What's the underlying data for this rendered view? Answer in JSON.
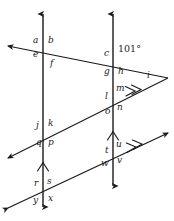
{
  "figure": {
    "stroke_color": "#1a1a1a",
    "background_color": "#ffffff",
    "width": 174,
    "height": 221
  },
  "angle_measures": [
    {
      "id": "measure-101",
      "text": "101°",
      "x": 118,
      "y": 49
    }
  ],
  "angle_labels": [
    {
      "id": "a",
      "text": "a",
      "x": 33,
      "y": 41
    },
    {
      "id": "b",
      "text": "b",
      "x": 48,
      "y": 41
    },
    {
      "id": "e",
      "text": "e",
      "x": 33,
      "y": 55
    },
    {
      "id": "f",
      "text": "f",
      "x": 50,
      "y": 64
    },
    {
      "id": "c",
      "text": "c",
      "x": 104,
      "y": 54
    },
    {
      "id": "g",
      "text": "g",
      "x": 104,
      "y": 72
    },
    {
      "id": "h",
      "text": "h",
      "x": 118,
      "y": 72
    },
    {
      "id": "i",
      "text": "i",
      "x": 147,
      "y": 76
    },
    {
      "id": "m",
      "text": "m",
      "x": 116,
      "y": 89
    },
    {
      "id": "l",
      "text": "l",
      "x": 105,
      "y": 97
    },
    {
      "id": "n",
      "text": "n",
      "x": 117,
      "y": 108
    },
    {
      "id": "o",
      "text": "o",
      "x": 105,
      "y": 112
    },
    {
      "id": "j",
      "text": "j",
      "x": 36,
      "y": 126
    },
    {
      "id": "k",
      "text": "k",
      "x": 48,
      "y": 124
    },
    {
      "id": "q",
      "text": "q",
      "x": 36,
      "y": 143
    },
    {
      "id": "p",
      "text": "p",
      "x": 48,
      "y": 143
    },
    {
      "id": "u",
      "text": "u",
      "x": 116,
      "y": 145
    },
    {
      "id": "t",
      "text": "t",
      "x": 105,
      "y": 151
    },
    {
      "id": "v",
      "text": "v",
      "x": 117,
      "y": 161
    },
    {
      "id": "w",
      "text": "w",
      "x": 101,
      "y": 164
    },
    {
      "id": "r",
      "text": "r",
      "x": 34,
      "y": 184
    },
    {
      "id": "s",
      "text": "s",
      "x": 47,
      "y": 182
    },
    {
      "id": "y",
      "text": "y",
      "x": 33,
      "y": 201
    },
    {
      "id": "x",
      "text": "x",
      "x": 48,
      "y": 199
    }
  ],
  "lines": {
    "vertical_left": {
      "name": "vertical-line-left",
      "x": 43,
      "y_top": 14,
      "y_bottom": 207
    },
    "vertical_right": {
      "name": "vertical-line-right",
      "x": 113,
      "y_top": 14,
      "y_bottom": 186
    },
    "transversal_top": {
      "name": "transversal-top",
      "x1": 8,
      "y1": 46,
      "x2": 168,
      "y2": 78
    },
    "transversal_middle": {
      "name": "transversal-middle",
      "x1": 8,
      "y1": 158,
      "x2": 168,
      "y2": 78
    },
    "transversal_bottom": {
      "name": "transversal-bottom",
      "x1": 8,
      "y1": 208,
      "x2": 168,
      "y2": 133
    }
  },
  "parallel_marks": {
    "vertical_left_chevron": {
      "name": "parallel-mark-single-left",
      "count": 1
    },
    "vertical_right_chevron": {
      "name": "parallel-mark-single-right",
      "count": 1
    },
    "transversal_middle_chevron": {
      "name": "parallel-mark-double-middle",
      "count": 2
    },
    "transversal_bottom_chevron": {
      "name": "parallel-mark-double-bottom",
      "count": 2
    }
  }
}
